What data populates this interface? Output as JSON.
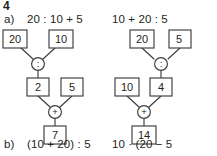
{
  "exercise": {
    "number": "4"
  },
  "items": {
    "a_label": "a)",
    "a_expression": "20 : 10 + 5",
    "b_label": "b)",
    "b_expression": "(10 + 20) : 5",
    "right_top_expression": "10 + 20 : 5",
    "right_bottom_expression": "10 · (20 − 5"
  },
  "colors": {
    "ink": "#231f20",
    "stroke": "#3d3d3d",
    "paper": "#ffffff"
  },
  "trees": {
    "left": {
      "name": "calculation-tree-a",
      "operand_top_left": "20",
      "operand_top_right": "10",
      "operator_top": ":",
      "result_mid_left": "2",
      "operand_mid_right": "5",
      "operator_bottom": "+",
      "result_final": "7"
    },
    "right": {
      "name": "calculation-tree-right",
      "operand_top_left": "20",
      "operand_top_right": "5",
      "operator_top": ":",
      "operand_mid_left": "10",
      "result_mid_right": "4",
      "operator_bottom": "+",
      "result_final": "14"
    }
  }
}
